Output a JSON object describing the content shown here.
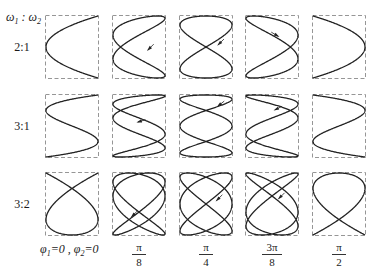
{
  "header": {
    "ratio_symbol_left": "ω",
    "ratio_sub_left": "1",
    "ratio_sep": " : ",
    "ratio_symbol_right": "ω",
    "ratio_sub_right": "2"
  },
  "rows": [
    {
      "label": "2:1",
      "w1": 2,
      "w2": 1,
      "top": 15
    },
    {
      "label": "3:1",
      "w1": 3,
      "w2": 1,
      "top": 94
    },
    {
      "label": "3:2",
      "w1": 3,
      "w2": 2,
      "top": 172
    }
  ],
  "columns": [
    {
      "phase": "0",
      "phase_value": 0,
      "num": "",
      "den": "",
      "left": 45
    },
    {
      "phase": "π/8",
      "phase_value": 0.392699,
      "num": "π",
      "den": "8",
      "left": 112
    },
    {
      "phase": "π/4",
      "phase_value": 0.785398,
      "num": "π",
      "den": "4",
      "left": 179
    },
    {
      "phase": "3π/8",
      "phase_value": 1.178097,
      "num": "3π",
      "den": "8",
      "left": 245
    },
    {
      "phase": "π/2",
      "phase_value": 1.570796,
      "num": "π",
      "den": "2",
      "left": 312
    }
  ],
  "bottom_caption": {
    "phi1": "φ",
    "phi1_sub": "1",
    "phi1_val": "=0",
    "sep": " , ",
    "phi2": "φ",
    "phi2_sub": "2",
    "phi2_val": "=0"
  },
  "arrows": [
    {
      "row": 0,
      "col": 1,
      "x": 0.72,
      "y": 0.5,
      "dir": [
        -1,
        1
      ]
    },
    {
      "row": 0,
      "col": 2,
      "x": 0.78,
      "y": 0.42,
      "dir": [
        -1,
        1
      ]
    },
    {
      "row": 0,
      "col": 3,
      "x": 0.55,
      "y": 0.3,
      "dir": [
        1,
        0.6
      ]
    },
    {
      "row": 1,
      "col": 1,
      "x": 0.55,
      "y": 0.42,
      "dir": [
        -1,
        0.3
      ]
    },
    {
      "row": 1,
      "col": 2,
      "x": 0.78,
      "y": 0.15,
      "dir": [
        -1,
        0.8
      ]
    },
    {
      "row": 1,
      "col": 3,
      "x": 0.62,
      "y": 0.22,
      "dir": [
        -1,
        0.5
      ]
    },
    {
      "row": 2,
      "col": 1,
      "x": 0.42,
      "y": 0.65,
      "dir": [
        -1,
        1
      ]
    },
    {
      "row": 2,
      "col": 2,
      "x": 0.75,
      "y": 0.4,
      "dir": [
        -1,
        1
      ]
    },
    {
      "row": 2,
      "col": 3,
      "x": 0.68,
      "y": 0.37,
      "dir": [
        -1,
        1
      ]
    }
  ],
  "colors": {
    "curve": "#222222",
    "frame": "#8a8a8a"
  }
}
